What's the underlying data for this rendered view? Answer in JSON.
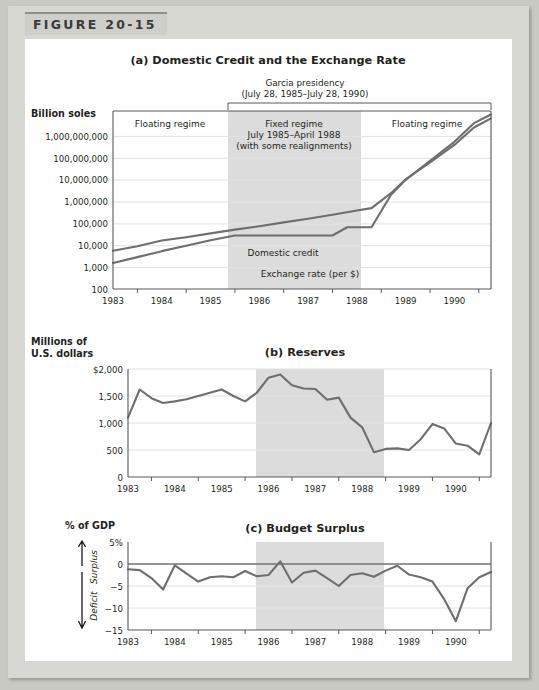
{
  "figure": {
    "label": "FIGURE 20-15"
  },
  "panel_a": {
    "title": "(a) Domestic Credit and the Exchange Rate",
    "bracket_label_line1": "Garcia presidency",
    "bracket_label_line2": "(July 28, 1985–July 28, 1990)",
    "y_axis_label": "Billion soles",
    "regime_left": "Floating regime",
    "regime_right": "Floating regime",
    "regime_mid_line1": "Fixed regime",
    "regime_mid_line2": "July 1985–April 1988",
    "regime_mid_line3": "(with some realignments)",
    "series_label_credit": "Domestic credit",
    "series_label_fx": "Exchange rate (per $)"
  },
  "panel_b": {
    "title": "(b) Reserves",
    "y_axis_label_line1": "Millions of",
    "y_axis_label_line2": "U.S. dollars"
  },
  "panel_c": {
    "title": "(c) Budget Surplus",
    "y_axis_label": "% of GDP",
    "surplus_label": "Surplus",
    "deficit_label": "Deficit"
  },
  "colors": {
    "series": "#6d6e70",
    "shade": "#dcdcdc",
    "axis": "#58585a",
    "page": "#c9c9c4",
    "frame": "#d8d8d3"
  },
  "chart_data": [
    {
      "type": "line",
      "title": "(a) Domestic Credit and the Exchange Rate",
      "xlabel": "",
      "ylabel": "Billion soles",
      "yscale": "log",
      "ylim": [
        100,
        1000000000
      ],
      "xlim": [
        1983,
        1990.75
      ],
      "grid": true,
      "ytick_labels": [
        "100",
        "1,000",
        "10,000",
        "100,000",
        "1,000,000",
        "10,000,000",
        "100,000,000",
        "1,000,000,000"
      ],
      "ytick_values": [
        100,
        1000,
        10000,
        100000,
        1000000,
        10000000,
        100000000,
        1000000000
      ],
      "xtick_labels": [
        "1983",
        "1984",
        "1985",
        "1986",
        "1987",
        "1988",
        "1989",
        "1990"
      ],
      "xtick_values": [
        1983,
        1984,
        1985,
        1986,
        1987,
        1988,
        1989,
        1990
      ],
      "shaded_region": {
        "from": 1985.5,
        "to": 1988.3,
        "label": "Fixed regime"
      },
      "series": [
        {
          "name": "Domestic credit",
          "x": [
            1983.0,
            1983.5,
            1984.0,
            1984.5,
            1985.0,
            1985.5,
            1986.0,
            1986.5,
            1987.0,
            1987.5,
            1988.0,
            1988.3,
            1988.7,
            1989.0,
            1989.5,
            1990.0,
            1990.4,
            1990.75
          ],
          "y": [
            3400,
            5200,
            8800,
            12000,
            17000,
            24000,
            33000,
            47000,
            66000,
            95000,
            140000,
            175000,
            700000,
            2500000,
            12000000,
            60000000,
            300000000,
            700000000
          ]
        },
        {
          "name": "Exchange rate (per $)",
          "x": [
            1983.0,
            1983.5,
            1984.0,
            1984.5,
            1985.0,
            1985.5,
            1986.0,
            1986.5,
            1987.0,
            1987.5,
            1987.8,
            1988.0,
            1988.3,
            1988.7,
            1989.0,
            1989.5,
            1990.0,
            1990.4,
            1990.75
          ],
          "y": [
            1100,
            1900,
            3300,
            5400,
            9000,
            14000,
            14000,
            14000,
            14000,
            14000,
            30000,
            30000,
            30000,
            600000,
            2400000,
            14000000,
            80000000,
            450000000,
            1000000000
          ]
        }
      ]
    },
    {
      "type": "line",
      "title": "(b) Reserves",
      "xlabel": "",
      "ylabel": "Millions of U.S. dollars",
      "ylim": [
        0,
        2000
      ],
      "xlim": [
        1983,
        1990.75
      ],
      "grid": true,
      "ytick_labels": [
        "0",
        "500",
        "1,000",
        "1,500",
        "$2,000"
      ],
      "ytick_values": [
        0,
        500,
        1000,
        1500,
        2000
      ],
      "xtick_labels": [
        "1983",
        "1984",
        "1985",
        "1986",
        "1987",
        "1988",
        "1989",
        "1990"
      ],
      "xtick_values": [
        1983,
        1984,
        1985,
        1986,
        1987,
        1988,
        1989,
        1990
      ],
      "shaded_region": {
        "from": 1985.5,
        "to": 1988.3
      },
      "series": [
        {
          "name": "Reserves",
          "x": [
            1983.0,
            1983.25,
            1983.5,
            1983.75,
            1984.0,
            1984.25,
            1984.5,
            1984.75,
            1985.0,
            1985.25,
            1985.5,
            1985.75,
            1986.0,
            1986.25,
            1986.5,
            1986.75,
            1987.0,
            1987.25,
            1987.5,
            1987.75,
            1988.0,
            1988.25,
            1988.5,
            1988.75,
            1989.0,
            1989.25,
            1989.5,
            1989.75,
            1990.0,
            1990.25,
            1990.5,
            1990.75
          ],
          "y": [
            1100,
            1620,
            1460,
            1370,
            1400,
            1440,
            1500,
            1560,
            1620,
            1500,
            1400,
            1560,
            1840,
            1900,
            1700,
            1640,
            1630,
            1430,
            1470,
            1100,
            920,
            460,
            520,
            530,
            500,
            700,
            980,
            900,
            620,
            580,
            420,
            1000
          ]
        }
      ]
    },
    {
      "type": "line",
      "title": "(c) Budget Surplus",
      "xlabel": "",
      "ylabel": "% of GDP",
      "ylim": [
        -15,
        5
      ],
      "xlim": [
        1983,
        1990.75
      ],
      "grid": true,
      "ytick_labels": [
        "-15",
        "-10",
        "-5",
        "0",
        "5%"
      ],
      "ytick_values": [
        -15,
        -10,
        -5,
        0,
        5
      ],
      "xtick_labels": [
        "1983",
        "1984",
        "1985",
        "1986",
        "1987",
        "1988",
        "1989",
        "1990"
      ],
      "xtick_values": [
        1983,
        1984,
        1985,
        1986,
        1987,
        1988,
        1989,
        1990
      ],
      "shaded_region": {
        "from": 1985.5,
        "to": 1988.3
      },
      "annotations": [
        "Surplus",
        "Deficit"
      ],
      "series": [
        {
          "name": "Budget surplus",
          "x": [
            1983.0,
            1983.25,
            1983.5,
            1983.75,
            1984.0,
            1984.25,
            1984.5,
            1984.75,
            1985.0,
            1985.25,
            1985.5,
            1985.75,
            1986.0,
            1986.25,
            1986.5,
            1986.75,
            1987.0,
            1987.25,
            1987.5,
            1987.75,
            1988.0,
            1988.25,
            1988.5,
            1988.75,
            1989.0,
            1989.25,
            1989.5,
            1989.75,
            1990.0,
            1990.25,
            1990.5,
            1990.75
          ],
          "y": [
            -1.2,
            -1.4,
            -3.2,
            -5.8,
            -0.3,
            -2.2,
            -4.0,
            -3.0,
            -2.8,
            -3.0,
            -1.6,
            -2.8,
            -2.5,
            0.6,
            -4.2,
            -2.0,
            -1.5,
            -3.2,
            -5.0,
            -2.5,
            -2.1,
            -2.9,
            -1.5,
            -0.4,
            -2.4,
            -3.0,
            -4.0,
            -8.0,
            -13.0,
            -5.5,
            -3.0,
            -1.8
          ]
        }
      ]
    }
  ]
}
